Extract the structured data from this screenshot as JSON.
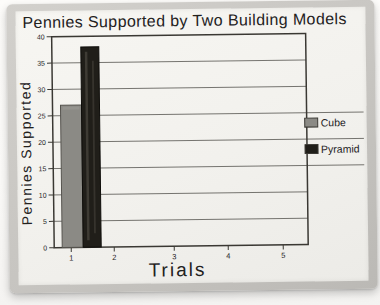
{
  "chart_data": {
    "type": "bar",
    "title": "Pennies Supported by Two Building Models",
    "xlabel": "Trials",
    "ylabel": "Pennies Supported",
    "x_tick_labels": [
      "1",
      "2",
      "3",
      "4",
      "5"
    ],
    "y_tick_labels": [
      "0",
      "5",
      "10",
      "15",
      "20",
      "25",
      "30",
      "35",
      "40"
    ],
    "ylim": [
      0,
      40
    ],
    "ytick_step": 5,
    "grid": true,
    "legend_position": "right",
    "categories": [
      "Trial 1"
    ],
    "series": [
      {
        "name": "Cube",
        "color": "#8b8a85",
        "values": [
          27
        ]
      },
      {
        "name": "Pyramid",
        "color": "#201e19",
        "values": [
          38
        ]
      }
    ]
  },
  "palette": {
    "paper": "#f2f1ed",
    "mat": "#c7c5c1",
    "ink": "#3a3833",
    "cube_bar": "#8b8a85",
    "pyramid_bar": "#201e19"
  }
}
